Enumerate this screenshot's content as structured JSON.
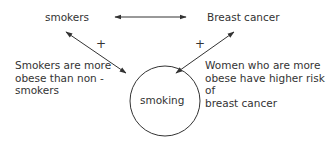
{
  "nodes": {
    "top_left": "smokers",
    "top_right": "Breast cancer",
    "center": "smoking"
  },
  "edges": {
    "left_sign": "+",
    "right_sign": "+"
  },
  "annotations": {
    "left": [
      "Smokers are more",
      "obese than non -",
      "smokers"
    ],
    "right": [
      "Women who are more",
      "obese have higher risk of",
      "breast cancer"
    ]
  },
  "colors": {
    "line": "#333333",
    "text": "#333333",
    "background": "#ffffff"
  }
}
